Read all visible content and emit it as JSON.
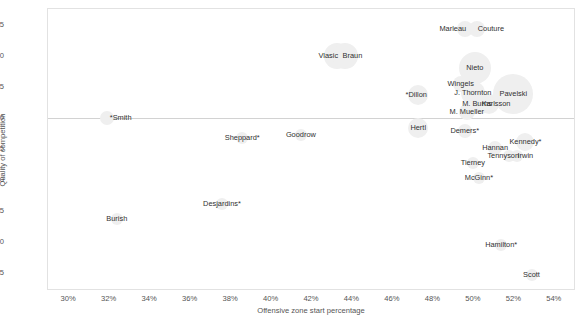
{
  "chart_data": {
    "type": "scatter",
    "title": "",
    "xlabel": "Offensive zone start percentage",
    "ylabel": "Quality of competition",
    "xlim": [
      29.0,
      55.0
    ],
    "ylim": [
      -2.75,
      1.75
    ],
    "xticks": [
      "30%",
      "32%",
      "34%",
      "36%",
      "38%",
      "40%",
      "42%",
      "44%",
      "46%",
      "48%",
      "50%",
      "52%",
      "54%"
    ],
    "xtick_values": [
      30,
      32,
      34,
      36,
      38,
      40,
      42,
      44,
      46,
      48,
      50,
      52,
      54
    ],
    "yticks": [
      "1.5",
      "1.0",
      "0.5",
      "0.0",
      "-0.5",
      "-1.0",
      "-1.5",
      "-2.0",
      "-2.5"
    ],
    "ytick_values": [
      1.5,
      1.0,
      0.5,
      0.0,
      -0.5,
      -1.0,
      -1.5,
      -2.0,
      -2.5
    ],
    "grid": false,
    "legend": null,
    "zero_reference_line": 0.0,
    "bubble_color": "#efefef",
    "label_color": "#2f2f2f",
    "axis_color": "#555555",
    "points": [
      {
        "label": "*Smith",
        "x": 31.9,
        "y": 0.0,
        "size": 7,
        "label_dx": 14,
        "label_dy": -4
      },
      {
        "label": "Burish",
        "x": 32.4,
        "y": -1.62,
        "size": 6,
        "label_dx": 0,
        "label_dy": -4
      },
      {
        "label": "Sheppard*",
        "x": 38.6,
        "y": -0.33,
        "size": 6,
        "label_dx": 0,
        "label_dy": -4
      },
      {
        "label": "Desjardins*",
        "x": 37.6,
        "y": -1.38,
        "size": 6,
        "label_dx": 0,
        "label_dy": -4
      },
      {
        "label": "Vlasic",
        "x": 43.3,
        "y": 1.0,
        "size": 13,
        "label_dx": -9,
        "label_dy": -4
      },
      {
        "label": "Braun",
        "x": 43.7,
        "y": 1.0,
        "size": 13,
        "label_dx": 7,
        "label_dy": -4
      },
      {
        "label": "Goodrow",
        "x": 41.5,
        "y": -0.28,
        "size": 6,
        "label_dx": 0,
        "label_dy": -4
      },
      {
        "label": "*Dillon",
        "x": 47.3,
        "y": 0.36,
        "size": 10,
        "label_dx": -2,
        "label_dy": -4
      },
      {
        "label": "Hertl",
        "x": 47.3,
        "y": -0.16,
        "size": 10,
        "label_dx": 0,
        "label_dy": -4
      },
      {
        "label": "Marleau",
        "x": 49.6,
        "y": 1.43,
        "size": 8,
        "label_dx": -12,
        "label_dy": -4
      },
      {
        "label": "Couture",
        "x": 50.2,
        "y": 1.43,
        "size": 8,
        "label_dx": 14,
        "label_dy": -4
      },
      {
        "label": "Nieto",
        "x": 50.1,
        "y": 0.8,
        "size": 16,
        "label_dx": 0,
        "label_dy": -4
      },
      {
        "label": "Wingels",
        "x": 49.4,
        "y": 0.55,
        "size": 8,
        "label_dx": 0,
        "label_dy": -4
      },
      {
        "label": "J. Thornton",
        "x": 50.0,
        "y": 0.4,
        "size": 12,
        "label_dx": 0,
        "label_dy": -4
      },
      {
        "label": "Pavelski",
        "x": 52.0,
        "y": 0.38,
        "size": 20,
        "label_dx": 0,
        "label_dy": -4
      },
      {
        "label": "M. Burns",
        "x": 50.4,
        "y": 0.23,
        "size": 10,
        "label_dx": -4,
        "label_dy": -4
      },
      {
        "label": "Karlsson",
        "x": 50.8,
        "y": 0.23,
        "size": 10,
        "label_dx": 7,
        "label_dy": -4
      },
      {
        "label": "M. Mueller",
        "x": 49.7,
        "y": 0.1,
        "size": 8,
        "label_dx": 0,
        "label_dy": -4
      },
      {
        "label": "Demers*",
        "x": 49.6,
        "y": -0.21,
        "size": 7,
        "label_dx": 0,
        "label_dy": -4
      },
      {
        "label": "Hannan",
        "x": 51.1,
        "y": -0.48,
        "size": 7,
        "label_dx": 0,
        "label_dy": -4
      },
      {
        "label": "Kennedy*",
        "x": 52.6,
        "y": -0.38,
        "size": 9,
        "label_dx": 0,
        "label_dy": -4
      },
      {
        "label": "Tennyson",
        "x": 51.8,
        "y": -0.62,
        "size": 6,
        "label_dx": -6,
        "label_dy": -4
      },
      {
        "label": "Irwin",
        "x": 52.2,
        "y": -0.62,
        "size": 6,
        "label_dx": 8,
        "label_dy": -4
      },
      {
        "label": "Tierney",
        "x": 50.0,
        "y": -0.72,
        "size": 6,
        "label_dx": 0,
        "label_dy": -4
      },
      {
        "label": "McGinn*",
        "x": 50.3,
        "y": -0.97,
        "size": 6,
        "label_dx": 0,
        "label_dy": -4
      },
      {
        "label": "Hamilton*",
        "x": 51.4,
        "y": -2.05,
        "size": 6,
        "label_dx": 0,
        "label_dy": -4
      },
      {
        "label": "Scott",
        "x": 52.9,
        "y": -2.52,
        "size": 6,
        "label_dx": 0,
        "label_dy": -4
      }
    ]
  }
}
